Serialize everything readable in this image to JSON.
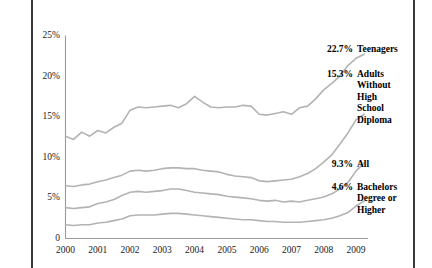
{
  "chart_data": {
    "type": "line",
    "title": "",
    "subtitle": "",
    "xlabel": "",
    "ylabel": "",
    "xlim": [
      2000,
      2009.25
    ],
    "ylim": [
      0,
      25
    ],
    "grid": false,
    "legend_position": "right-inline-annotations",
    "y_ticks": [
      "0",
      "5%",
      "10%",
      "15%",
      "20%",
      "25%"
    ],
    "y_tick_values": [
      0,
      5,
      10,
      15,
      20,
      25
    ],
    "x_ticks": [
      "2000",
      "2001",
      "2002",
      "2003",
      "2004",
      "2005",
      "2006",
      "2007",
      "2008",
      "2009"
    ],
    "x_tick_values": [
      2000,
      2001,
      2002,
      2003,
      2004,
      2005,
      2006,
      2007,
      2008,
      2009
    ],
    "line_color": "#b3b3b3",
    "axis_color": "#9a9a9a",
    "series": [
      {
        "name": "Teenagers",
        "end_label": "22.7%",
        "end_value": 22.7,
        "x": [
          2000.0,
          2000.25,
          2000.5,
          2000.75,
          2001.0,
          2001.25,
          2001.5,
          2001.75,
          2002.0,
          2002.25,
          2002.5,
          2002.75,
          2003.0,
          2003.25,
          2003.5,
          2003.75,
          2004.0,
          2004.25,
          2004.5,
          2004.75,
          2005.0,
          2005.25,
          2005.5,
          2005.75,
          2006.0,
          2006.25,
          2006.5,
          2006.75,
          2007.0,
          2007.25,
          2007.5,
          2007.75,
          2008.0,
          2008.25,
          2008.5,
          2008.75,
          2009.0,
          2009.25
        ],
        "values": [
          12.6,
          12.2,
          13.1,
          12.6,
          13.3,
          13.0,
          13.7,
          14.2,
          15.8,
          16.2,
          16.1,
          16.2,
          16.3,
          16.4,
          16.1,
          16.6,
          17.5,
          16.8,
          16.2,
          16.1,
          16.2,
          16.2,
          16.4,
          16.3,
          15.3,
          15.2,
          15.4,
          15.6,
          15.3,
          16.1,
          16.3,
          17.2,
          18.3,
          19.1,
          20.0,
          21.3,
          22.2,
          22.7
        ]
      },
      {
        "name": "Adults Without High School Diploma",
        "end_label": "15.3%",
        "end_value": 15.3,
        "x": [
          2000.0,
          2000.25,
          2000.5,
          2000.75,
          2001.0,
          2001.25,
          2001.5,
          2001.75,
          2002.0,
          2002.25,
          2002.5,
          2002.75,
          2003.0,
          2003.25,
          2003.5,
          2003.75,
          2004.0,
          2004.25,
          2004.5,
          2004.75,
          2005.0,
          2005.25,
          2005.5,
          2005.75,
          2006.0,
          2006.25,
          2006.5,
          2006.75,
          2007.0,
          2007.25,
          2007.5,
          2007.75,
          2008.0,
          2008.25,
          2008.5,
          2008.75,
          2009.0,
          2009.25
        ],
        "values": [
          6.5,
          6.4,
          6.6,
          6.7,
          7.0,
          7.2,
          7.5,
          7.8,
          8.3,
          8.4,
          8.3,
          8.4,
          8.6,
          8.7,
          8.7,
          8.6,
          8.6,
          8.4,
          8.3,
          8.2,
          7.9,
          7.7,
          7.6,
          7.5,
          7.1,
          7.0,
          7.1,
          7.2,
          7.3,
          7.6,
          8.0,
          8.6,
          9.4,
          10.3,
          11.6,
          13.0,
          14.6,
          15.3
        ]
      },
      {
        "name": "All",
        "end_label": "9.3%",
        "end_value": 9.3,
        "x": [
          2000.0,
          2000.25,
          2000.5,
          2000.75,
          2001.0,
          2001.25,
          2001.5,
          2001.75,
          2002.0,
          2002.25,
          2002.5,
          2002.75,
          2003.0,
          2003.25,
          2003.5,
          2003.75,
          2004.0,
          2004.25,
          2004.5,
          2004.75,
          2005.0,
          2005.25,
          2005.5,
          2005.75,
          2006.0,
          2006.25,
          2006.5,
          2006.75,
          2007.0,
          2007.25,
          2007.5,
          2007.75,
          2008.0,
          2008.25,
          2008.5,
          2008.75,
          2009.0,
          2009.25
        ],
        "values": [
          3.8,
          3.7,
          3.8,
          3.9,
          4.3,
          4.5,
          4.8,
          5.3,
          5.7,
          5.8,
          5.7,
          5.8,
          5.9,
          6.1,
          6.1,
          5.9,
          5.7,
          5.6,
          5.5,
          5.4,
          5.2,
          5.1,
          5.0,
          4.9,
          4.7,
          4.6,
          4.7,
          4.5,
          4.6,
          4.5,
          4.7,
          4.9,
          5.1,
          5.5,
          6.1,
          6.9,
          8.3,
          9.3
        ]
      },
      {
        "name": "Bachelors Degree or Higher",
        "end_label": "4.6%",
        "end_value": 4.6,
        "x": [
          2000.0,
          2000.25,
          2000.5,
          2000.75,
          2001.0,
          2001.25,
          2001.5,
          2001.75,
          2002.0,
          2002.25,
          2002.5,
          2002.75,
          2003.0,
          2003.25,
          2003.5,
          2003.75,
          2004.0,
          2004.25,
          2004.5,
          2004.75,
          2005.0,
          2005.25,
          2005.5,
          2005.75,
          2006.0,
          2006.25,
          2006.5,
          2006.75,
          2007.0,
          2007.25,
          2007.5,
          2007.75,
          2008.0,
          2008.25,
          2008.5,
          2008.75,
          2009.0,
          2009.25
        ],
        "values": [
          1.7,
          1.6,
          1.7,
          1.7,
          1.9,
          2.0,
          2.2,
          2.4,
          2.8,
          2.9,
          2.9,
          2.9,
          3.0,
          3.1,
          3.1,
          3.0,
          2.9,
          2.8,
          2.7,
          2.6,
          2.5,
          2.4,
          2.3,
          2.3,
          2.2,
          2.1,
          2.1,
          2.0,
          2.0,
          2.0,
          2.1,
          2.2,
          2.3,
          2.5,
          2.8,
          3.2,
          4.0,
          4.6
        ]
      }
    ]
  },
  "annotations": [
    {
      "value": "22.7%",
      "name": "Teenagers"
    },
    {
      "value": "15.3%",
      "name": "Adults\nWithout\nHigh\nSchool\nDiploma"
    },
    {
      "value": "9.3%",
      "name": "All"
    },
    {
      "value": "4.6%",
      "name": "Bachelors\nDegree or\nHigher"
    }
  ]
}
